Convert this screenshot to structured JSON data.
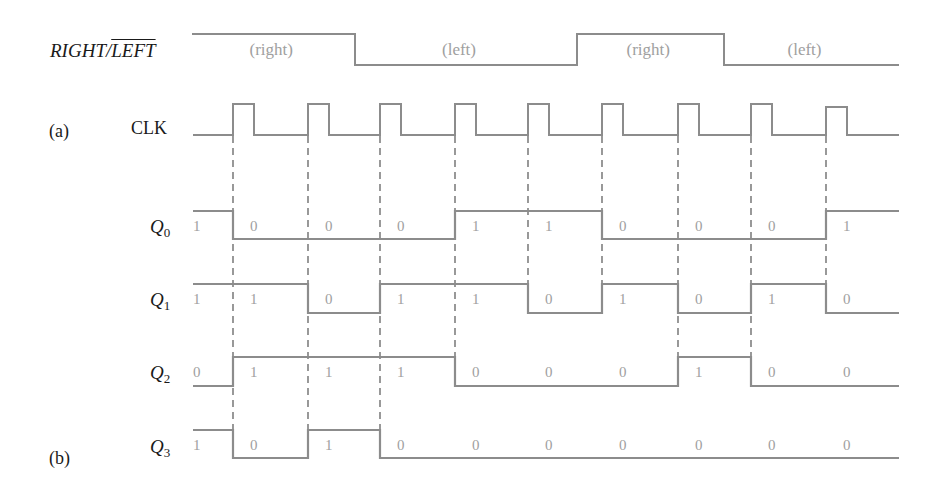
{
  "labels": {
    "part_a": "(a)",
    "part_b": "(b)",
    "dir_signal_right": "RIGHT/",
    "dir_signal_left": "LEFT",
    "clk": "CLK",
    "q_prefix": "Q",
    "q0_sub": "0",
    "q1_sub": "1",
    "q2_sub": "2",
    "q3_sub": "3"
  },
  "direction": {
    "segments": [
      {
        "mode": "(right)",
        "level": 1,
        "x0": 192,
        "x1": 355
      },
      {
        "mode": "(left)",
        "level": 0,
        "x0": 355,
        "x1": 577
      },
      {
        "mode": "(right)",
        "level": 1,
        "x0": 577,
        "x1": 724
      },
      {
        "mode": "(left)",
        "level": 0,
        "x0": 724,
        "x1": 899
      }
    ]
  },
  "clock": {
    "rising_edges": [
      233,
      308,
      380,
      455,
      528,
      602,
      678,
      751,
      826
    ],
    "pulse_width": 21,
    "start_x": 193,
    "end_x": 899
  },
  "outputs": {
    "Q0": [
      1,
      0,
      0,
      0,
      1,
      1,
      0,
      0,
      0,
      1
    ],
    "Q1": [
      1,
      1,
      0,
      1,
      1,
      0,
      1,
      0,
      1,
      0
    ],
    "Q2": [
      0,
      1,
      1,
      1,
      0,
      0,
      0,
      1,
      0,
      0
    ],
    "Q3": [
      1,
      0,
      1,
      0,
      0,
      0,
      0,
      0,
      0,
      0
    ]
  },
  "dashed_line_bottoms": [
    430,
    430,
    430,
    357,
    284,
    284,
    357,
    357,
    284
  ],
  "colors": {
    "waveform": "#8c8c8c",
    "value_text": "#a0a0a0",
    "label_text": "#1a1a1a",
    "dashed": "#555555"
  }
}
